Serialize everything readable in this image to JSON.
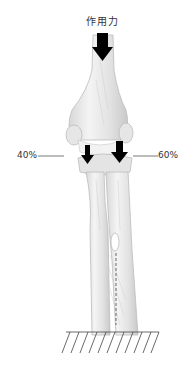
{
  "diagram": {
    "force_label": "作用力",
    "left_percent": "40%",
    "right_percent": "60%",
    "colors": {
      "bone_fill": "#ebebeb",
      "bone_shadow": "#c8c8c8",
      "arrow": "#000000",
      "line": "#555555",
      "text": "#333333"
    }
  }
}
